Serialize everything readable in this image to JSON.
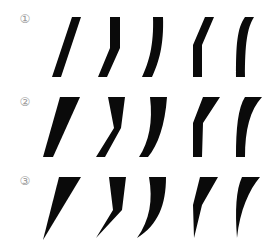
{
  "diagram": {
    "type": "calligraphy-stroke-variations",
    "background": "#ffffff",
    "stroke_color": "#0a0a0a",
    "label_color": "#9a9a9a",
    "rows": [
      {
        "label": "①",
        "description": "uniform-width strokes",
        "strokes": [
          {
            "name": "straight-slant",
            "path": "M72,17 L81,17 L61,77 L52,77 Z"
          },
          {
            "name": "vertical-then-slant",
            "path": "M110,17 L120,17 L120,48 L107,77 L98,77 L110,48 Z"
          },
          {
            "name": "curved-right",
            "path": "M153,17 L163,17 C164,45 159,62 152,77 L142,77 C149,62 154,45 153,17 Z"
          },
          {
            "name": "slant-then-vertical",
            "path": "M205,17 L214,17 L202,45 L202,77 L193,77 L193,45 Z"
          },
          {
            "name": "curved-left",
            "path": "M245,17 L254,17 C247,28 245,45 245,77 L236,77 C236,45 237,28 245,17 Z"
          }
        ]
      },
      {
        "label": "②",
        "description": "wide-top tapering strokes with flat base",
        "strokes": [
          {
            "name": "straight-slant",
            "path": "M60,97 L80,97 L53,157 L43,157 Z"
          },
          {
            "name": "vertical-then-slant",
            "path": "M108,97 L125,97 L121,128 L105,157 L96,157 L114,128 Z"
          },
          {
            "name": "curved-right",
            "path": "M150,97 L167,97 C165,125 158,145 148,157 L139,157 C149,142 153,122 150,97 Z"
          },
          {
            "name": "slant-then-vertical",
            "path": "M203,97 L220,97 L203,123 L202,157 L193,157 L193,123 Z"
          },
          {
            "name": "curved-left",
            "path": "M245,97 L262,97 C250,110 245,130 245,157 L236,157 C236,128 238,108 245,97 Z"
          }
        ]
      },
      {
        "label": "③",
        "description": "wide-top strokes tapering to a point",
        "strokes": [
          {
            "name": "straight-slant",
            "path": "M59,177 L81,177 L43,240 Z"
          },
          {
            "name": "vertical-then-slant",
            "path": "M109,177 L126,177 L122,210 L96,238 L113,210 Z"
          },
          {
            "name": "curved-right",
            "path": "M149,177 L166,177 C166,205 158,225 137,238 C150,220 153,200 149,177 Z"
          },
          {
            "name": "slant-then-vertical",
            "path": "M200,177 L218,177 L202,205 L194,238 L193,205 Z"
          },
          {
            "name": "curved-left",
            "path": "M242,177 L260,177 C249,190 240,210 237,238 C235,210 236,190 242,177 Z"
          }
        ]
      }
    ]
  }
}
